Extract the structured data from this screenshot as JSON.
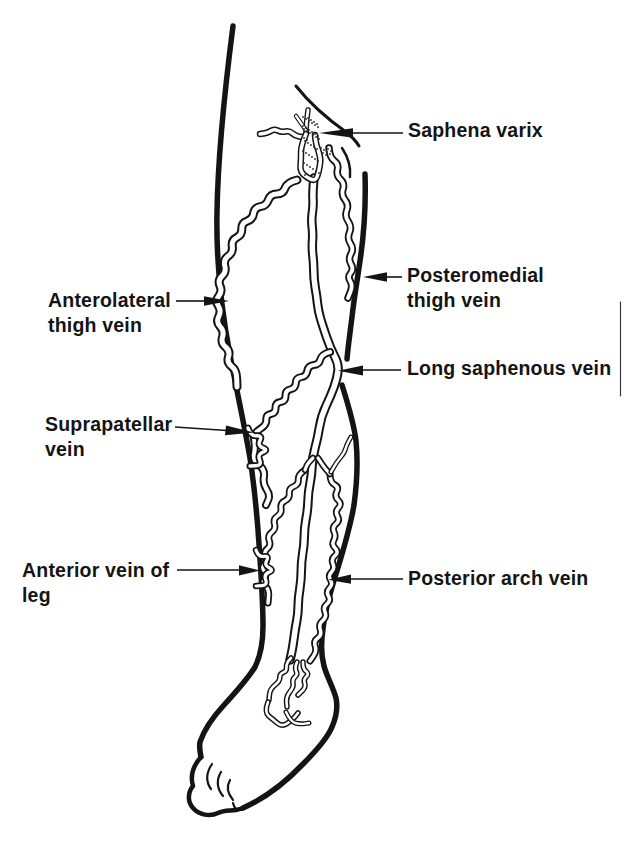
{
  "figure": {
    "ink_color": "#141414",
    "background_color": "#ffffff",
    "labels": {
      "saphena_varix": {
        "lines": [
          "Saphena varix"
        ]
      },
      "anterolateral_thigh_vein": {
        "lines": [
          "Anterolateral",
          "thigh vein"
        ]
      },
      "posteromedial_thigh_vein": {
        "lines": [
          "Posteromedial",
          "thigh vein"
        ]
      },
      "long_saphenous_vein": {
        "lines": [
          "Long saphenous vein"
        ]
      },
      "suprapatellar_vein": {
        "lines": [
          "Suprapatellar",
          "vein"
        ]
      },
      "anterior_vein_of_leg": {
        "lines": [
          "Anterior vein of",
          "leg"
        ]
      },
      "posterior_arch_vein": {
        "lines": [
          "Posterior arch vein"
        ]
      }
    }
  }
}
